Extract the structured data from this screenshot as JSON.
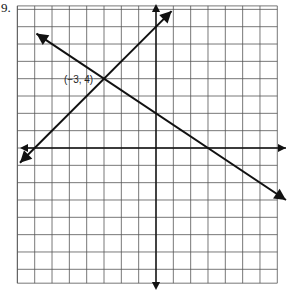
{
  "problem_number": "9.",
  "chart_data": {
    "type": "line",
    "title": "",
    "xlabel": "",
    "ylabel": "",
    "grid": true,
    "xlim": [
      -8,
      7
    ],
    "ylim": [
      -7.8,
      8.2
    ],
    "axes_arrows": true,
    "series": [
      {
        "name": "line-1",
        "equation": "y = x + 7",
        "slope": 1,
        "intercept": 7,
        "x_range": [
          -7.85,
          0.9
        ],
        "arrows": "both"
      },
      {
        "name": "line-2",
        "equation": "y = -2/3 x + 2",
        "slope": -0.6667,
        "intercept": 2,
        "x_range": [
          -6.9,
          7.5
        ],
        "arrows": "both"
      }
    ],
    "annotations": [
      {
        "text": "(−3, 4)",
        "x": -3,
        "y": 4
      }
    ]
  }
}
